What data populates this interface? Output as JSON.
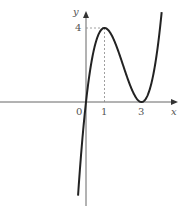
{
  "chart_data": {
    "type": "line",
    "title": "",
    "function": "y = x(x-3)^2",
    "xlabel": "x",
    "ylabel": "y",
    "origin_label": "0",
    "x_ticks": [
      {
        "value": 1,
        "label": "1"
      },
      {
        "value": 3,
        "label": "3"
      }
    ],
    "y_ticks": [
      {
        "value": 4,
        "label": "4"
      }
    ],
    "annotations": [
      "dashed guide from (1,0) to (1,4) and to y-axis at y=4"
    ],
    "key_points": [
      {
        "x": 0,
        "y": 0,
        "note": "root"
      },
      {
        "x": 1,
        "y": 4,
        "note": "local maximum"
      },
      {
        "x": 3,
        "y": 0,
        "note": "local minimum / double root"
      }
    ],
    "xlim": [
      -4.6,
      5.4
    ],
    "ylim": [
      -5.8,
      5.4
    ],
    "grid": false,
    "legend": null
  },
  "colors": {
    "curve": "#222222",
    "axis": "#666666",
    "dash": "#888888"
  }
}
